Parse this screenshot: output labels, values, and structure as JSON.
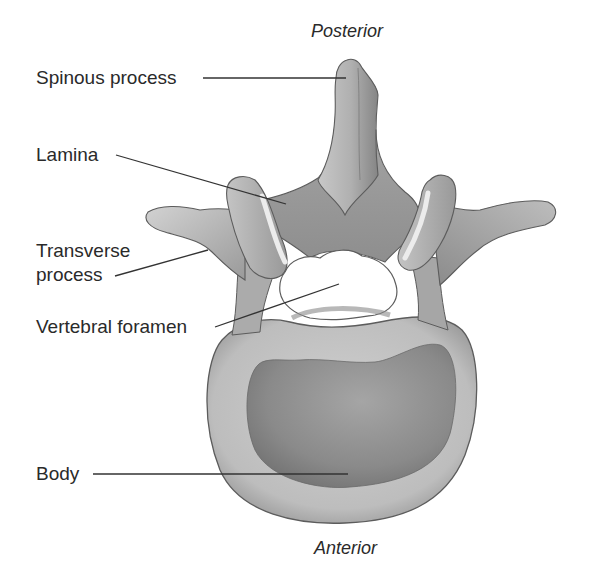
{
  "diagram": {
    "orientation": {
      "top": "Posterior",
      "bottom": "Anterior"
    },
    "labels": [
      {
        "id": "spinous-process",
        "text": "Spinous process"
      },
      {
        "id": "lamina",
        "text": "Lamina"
      },
      {
        "id": "transverse-process-line1",
        "text": "Transverse"
      },
      {
        "id": "transverse-process-line2",
        "text": "process"
      },
      {
        "id": "vertebral-foramen",
        "text": "Vertebral foramen"
      },
      {
        "id": "body",
        "text": "Body"
      }
    ],
    "colors": {
      "text": "#2a2a2a",
      "leader_line": "#333333",
      "bone_light": "#d4d4d4",
      "bone_mid": "#a8a8a8",
      "bone_dark": "#7a7a7a",
      "outline": "#555555",
      "background": "#ffffff"
    }
  }
}
